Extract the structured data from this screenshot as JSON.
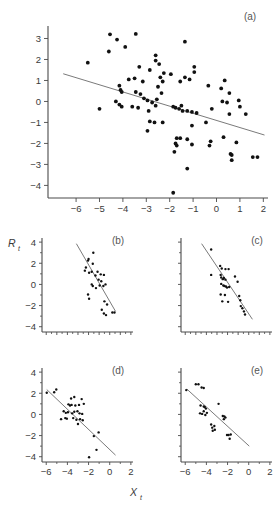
{
  "figure": {
    "axis_titles": {
      "y": "R",
      "y_sub": "t",
      "x": "X",
      "x_sub": "t"
    },
    "panel_tags": [
      "(a)",
      "(b)",
      "(c)",
      "(d)",
      "(e)"
    ]
  },
  "chart_data": [
    {
      "id": "a",
      "type": "scatter",
      "title": "(a)",
      "xlabel": "X_t",
      "ylabel": "R_t",
      "xlim": [
        -7.2,
        2.2
      ],
      "ylim": [
        -4.6,
        3.5
      ],
      "xticks": [
        -6,
        -5,
        -4,
        -3,
        -2,
        -1,
        0,
        1,
        2
      ],
      "yticks": [
        3,
        2,
        1,
        0,
        -1,
        -2,
        -3,
        -4
      ],
      "grid": false,
      "legend": "none",
      "fit_line": {
        "x": [
          -6.55,
          2.05
        ],
        "y": [
          1.32,
          -1.6
        ]
      },
      "points": [
        [
          -4.55,
          3.2
        ],
        [
          -3.45,
          3.22
        ],
        [
          -4.25,
          2.95
        ],
        [
          -3.9,
          2.6
        ],
        [
          -4.6,
          2.38
        ],
        [
          -1.35,
          2.85
        ],
        [
          -2.6,
          2.2
        ],
        [
          -2.6,
          1.95
        ],
        [
          -5.5,
          1.85
        ],
        [
          -3.3,
          1.65
        ],
        [
          -2.85,
          1.5
        ],
        [
          -2.45,
          1.78
        ],
        [
          -2.25,
          1.35
        ],
        [
          -1.95,
          1.3
        ],
        [
          -0.95,
          1.65
        ],
        [
          -0.95,
          1.4
        ],
        [
          -1.35,
          1.15
        ],
        [
          -1.55,
          0.95
        ],
        [
          -1.15,
          1.05
        ],
        [
          -3.75,
          1.05
        ],
        [
          -3.5,
          1.1
        ],
        [
          -3.15,
          0.95
        ],
        [
          -2.4,
          1.15
        ],
        [
          -2.3,
          0.95
        ],
        [
          -2.5,
          0.7
        ],
        [
          -0.35,
          0.75
        ],
        [
          0.35,
          1.0
        ],
        [
          0.2,
          0.62
        ],
        [
          0.55,
          0.4
        ],
        [
          -4.15,
          0.75
        ],
        [
          -4.1,
          0.55
        ],
        [
          -4.05,
          0.45
        ],
        [
          -3.45,
          0.45
        ],
        [
          -3.25,
          0.35
        ],
        [
          -2.35,
          0.4
        ],
        [
          -2.55,
          0.1
        ],
        [
          -3.1,
          0.15
        ],
        [
          -2.95,
          0.05
        ],
        [
          -4.3,
          0.0
        ],
        [
          -4.15,
          -0.15
        ],
        [
          -4.05,
          -0.25
        ],
        [
          -3.6,
          -0.25
        ],
        [
          -3.35,
          -0.3
        ],
        [
          -2.75,
          -0.05
        ],
        [
          -2.6,
          -0.2
        ],
        [
          -1.85,
          -0.25
        ],
        [
          -1.75,
          -0.3
        ],
        [
          -1.6,
          -0.35
        ],
        [
          -1.5,
          -0.2
        ],
        [
          -1.45,
          -0.45
        ],
        [
          -1.25,
          -0.45
        ],
        [
          -1.05,
          -0.5
        ],
        [
          -0.85,
          -0.55
        ],
        [
          0.25,
          0.0
        ],
        [
          0.45,
          -0.05
        ],
        [
          0.95,
          0.05
        ],
        [
          1.0,
          -0.25
        ],
        [
          -5.0,
          -0.35
        ],
        [
          -0.2,
          -0.35
        ],
        [
          -2.9,
          -0.45
        ],
        [
          -2.85,
          -0.95
        ],
        [
          -2.65,
          -1.0
        ],
        [
          -2.3,
          -1.0
        ],
        [
          -0.45,
          -1.0
        ],
        [
          -1.05,
          -1.15
        ],
        [
          -2.95,
          -1.4
        ],
        [
          0.55,
          -0.6
        ],
        [
          1.25,
          -0.6
        ],
        [
          -1.7,
          -1.75
        ],
        [
          -1.55,
          -1.75
        ],
        [
          -1.25,
          -1.8
        ],
        [
          -1.75,
          -2.0
        ],
        [
          -1.7,
          -2.1
        ],
        [
          -1.05,
          -2.05
        ],
        [
          -0.25,
          -1.9
        ],
        [
          -0.3,
          -2.1
        ],
        [
          0.3,
          -1.7
        ],
        [
          0.85,
          -1.95
        ],
        [
          -1.8,
          -2.4
        ],
        [
          -1.25,
          -3.2
        ],
        [
          0.6,
          -2.5
        ],
        [
          0.65,
          -2.55
        ],
        [
          0.65,
          -2.8
        ],
        [
          1.55,
          -2.65
        ],
        [
          1.75,
          -2.65
        ],
        [
          -1.85,
          -4.35
        ]
      ]
    },
    {
      "id": "b",
      "type": "scatter",
      "title": "(b)",
      "xlim": [
        -6.4,
        2.2
      ],
      "ylim": [
        -4.5,
        4.2
      ],
      "xticks": [
        -6,
        -5,
        -4,
        -3,
        -2,
        -1,
        0,
        1,
        2
      ],
      "yticks": [
        4,
        2,
        0,
        -2,
        -4
      ],
      "grid": false,
      "legend": "none",
      "fit_line": {
        "x": [
          -3.15,
          0.55
        ],
        "y": [
          3.85,
          -2.55
        ]
      },
      "points": [
        [
          -2.0,
          2.4
        ],
        [
          -2.05,
          2.25
        ],
        [
          -1.55,
          3.0
        ],
        [
          -2.35,
          1.3
        ],
        [
          -2.25,
          1.6
        ],
        [
          -1.95,
          1.1
        ],
        [
          -1.6,
          1.95
        ],
        [
          -1.7,
          1.2
        ],
        [
          -1.35,
          0.85
        ],
        [
          -1.15,
          1.2
        ],
        [
          -0.85,
          0.95
        ],
        [
          -1.05,
          0.45
        ],
        [
          -0.8,
          0.3
        ],
        [
          -0.55,
          0.9
        ],
        [
          -1.7,
          0.0
        ],
        [
          -1.6,
          -0.15
        ],
        [
          -1.3,
          -0.35
        ],
        [
          -0.95,
          -0.1
        ],
        [
          -0.6,
          -0.15
        ],
        [
          -0.4,
          0.0
        ],
        [
          -2.05,
          -0.95
        ],
        [
          -1.95,
          -1.35
        ],
        [
          -0.5,
          -1.6
        ],
        [
          -0.25,
          -1.9
        ],
        [
          -0.75,
          -2.4
        ],
        [
          -0.55,
          -2.75
        ],
        [
          -0.35,
          -2.9
        ],
        [
          0.25,
          -2.65
        ],
        [
          0.45,
          -2.65
        ]
      ]
    },
    {
      "id": "c",
      "type": "scatter",
      "title": "(c)",
      "xlim": [
        -6.4,
        2.2
      ],
      "ylim": [
        -4.5,
        4.2
      ],
      "xticks": [
        -6,
        -5,
        -4,
        -3,
        -2,
        -1,
        0,
        1,
        2
      ],
      "yticks": [
        4,
        2,
        0,
        -2,
        -4
      ],
      "grid": false,
      "legend": "none",
      "fit_line": {
        "x": [
          -4.45,
          0.35
        ],
        "y": [
          3.85,
          -3.3
        ]
      },
      "points": [
        [
          -3.55,
          3.3
        ],
        [
          -2.7,
          1.75
        ],
        [
          -2.55,
          1.5
        ],
        [
          -2.2,
          1.45
        ],
        [
          -1.9,
          1.45
        ],
        [
          -3.55,
          0.9
        ],
        [
          -2.65,
          0.9
        ],
        [
          -2.6,
          0.65
        ],
        [
          -2.45,
          0.5
        ],
        [
          -2.35,
          0.6
        ],
        [
          -2.2,
          0.45
        ],
        [
          -1.3,
          0.75
        ],
        [
          -2.6,
          0.05
        ],
        [
          -2.4,
          -0.1
        ],
        [
          -2.3,
          -0.15
        ],
        [
          -2.15,
          -0.2
        ],
        [
          -2.05,
          -0.3
        ],
        [
          -1.85,
          -0.25
        ],
        [
          -2.65,
          -0.95
        ],
        [
          -2.25,
          -1.0
        ],
        [
          -1.05,
          0.25
        ],
        [
          -2.5,
          -1.6
        ],
        [
          -1.95,
          -1.65
        ],
        [
          -0.9,
          -1.1
        ],
        [
          -0.8,
          -1.5
        ],
        [
          -0.75,
          -2.05
        ],
        [
          -0.6,
          -2.25
        ],
        [
          -0.45,
          -2.55
        ],
        [
          -0.35,
          -2.85
        ]
      ]
    },
    {
      "id": "d",
      "type": "scatter",
      "title": "(d)",
      "xlim": [
        -6.4,
        2.2
      ],
      "ylim": [
        -4.5,
        4.2
      ],
      "xticks": [
        -6,
        -4,
        -2,
        0,
        2
      ],
      "yticks": [
        4,
        2,
        0,
        -2,
        -4
      ],
      "grid": false,
      "legend": "none",
      "fit_line": {
        "x": [
          -5.95,
          0.55
        ],
        "y": [
          2.35,
          -3.85
        ]
      },
      "points": [
        [
          -5.95,
          2.05
        ],
        [
          -5.05,
          2.35
        ],
        [
          -5.25,
          2.1
        ],
        [
          -3.65,
          1.5
        ],
        [
          -3.35,
          1.65
        ],
        [
          -2.65,
          1.45
        ],
        [
          -3.9,
          0.95
        ],
        [
          -3.75,
          0.85
        ],
        [
          -3.6,
          0.9
        ],
        [
          -3.25,
          0.85
        ],
        [
          -2.9,
          0.9
        ],
        [
          -2.45,
          1.0
        ],
        [
          -4.35,
          0.3
        ],
        [
          -4.15,
          0.15
        ],
        [
          -3.95,
          0.2
        ],
        [
          -3.55,
          0.1
        ],
        [
          -3.35,
          0.25
        ],
        [
          -3.05,
          0.3
        ],
        [
          -2.85,
          0.1
        ],
        [
          -2.6,
          0.05
        ],
        [
          -4.6,
          -0.45
        ],
        [
          -4.2,
          -0.35
        ],
        [
          -4.05,
          -0.4
        ],
        [
          -3.45,
          -0.35
        ],
        [
          -3.15,
          -0.5
        ],
        [
          -2.8,
          -0.45
        ],
        [
          -2.55,
          -0.55
        ],
        [
          -3.0,
          -0.9
        ],
        [
          -1.05,
          -1.7
        ],
        [
          -1.5,
          -2.05
        ],
        [
          -1.25,
          -3.35
        ],
        [
          -1.95,
          -4.05
        ]
      ]
    },
    {
      "id": "e",
      "type": "scatter",
      "title": "(e)",
      "xlim": [
        -6.4,
        2.2
      ],
      "ylim": [
        -4.5,
        4.2
      ],
      "xticks": [
        -6,
        -4,
        -2,
        0,
        2
      ],
      "yticks": [
        4,
        2,
        0,
        -2,
        -4
      ],
      "grid": false,
      "legend": "none",
      "fit_line": {
        "x": [
          -5.85,
          0.05
        ],
        "y": [
          2.4,
          -3.0
        ]
      },
      "points": [
        [
          -5.0,
          2.85
        ],
        [
          -4.75,
          2.85
        ],
        [
          -4.45,
          2.55
        ],
        [
          -4.25,
          2.5
        ],
        [
          -5.9,
          2.3
        ],
        [
          -4.55,
          0.85
        ],
        [
          -4.25,
          0.75
        ],
        [
          -4.15,
          0.7
        ],
        [
          -4.05,
          0.55
        ],
        [
          -2.85,
          1.0
        ],
        [
          -4.6,
          0.1
        ],
        [
          -4.4,
          0.05
        ],
        [
          -4.25,
          0.3
        ],
        [
          -4.1,
          -0.05
        ],
        [
          -3.95,
          0.15
        ],
        [
          -2.45,
          -0.15
        ],
        [
          -2.3,
          -0.2
        ],
        [
          -2.2,
          -0.3
        ],
        [
          -2.35,
          -0.45
        ],
        [
          -3.55,
          -0.95
        ],
        [
          -3.45,
          -1.25
        ],
        [
          -3.25,
          -1.1
        ],
        [
          -3.2,
          -1.45
        ],
        [
          -3.4,
          -1.55
        ],
        [
          -2.05,
          -1.95
        ],
        [
          -1.9,
          -1.95
        ],
        [
          -1.7,
          -1.9
        ],
        [
          -1.8,
          -2.3
        ]
      ]
    }
  ]
}
